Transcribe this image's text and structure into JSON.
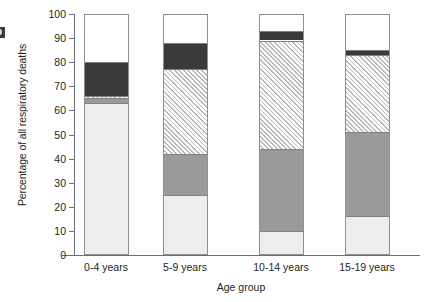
{
  "figure": {
    "edge_mark": "9"
  },
  "chart_data": {
    "type": "bar",
    "stacked": true,
    "title": "",
    "xlabel": "Age group",
    "ylabel": "Percentage of all respiratory deaths",
    "ylim": [
      0,
      100
    ],
    "grid": false,
    "legend_position": "none",
    "y_ticks": [
      0,
      10,
      20,
      30,
      40,
      50,
      60,
      70,
      80,
      90,
      100
    ],
    "y_tick_labels": [
      "0",
      "10",
      "20",
      "30",
      "40",
      "50",
      "60",
      "70",
      "80",
      "90",
      "100"
    ],
    "categories": [
      "0-4 years",
      "5-9 years",
      "10-14 years",
      "15-19 years"
    ],
    "series": [
      {
        "name": "light-grey-segment",
        "swatch": "#eeeeee",
        "values": [
          63,
          25,
          10,
          16
        ]
      },
      {
        "name": "grey-segment",
        "swatch": "#9a9a9c",
        "values": [
          2,
          17,
          34,
          35
        ]
      },
      {
        "name": "hatched-segment",
        "swatch": "hatch",
        "values": [
          1,
          35,
          45,
          32
        ]
      },
      {
        "name": "dark-segment",
        "swatch": "#3a3a3c",
        "values": [
          14,
          11,
          4,
          2
        ]
      },
      {
        "name": "white-segment",
        "swatch": "#ffffff",
        "values": [
          20,
          12,
          7,
          15
        ]
      }
    ],
    "stack_boundaries": {
      "0-4 years": [
        0,
        63,
        65,
        66,
        80,
        100
      ],
      "5-9 years": [
        0,
        25,
        42,
        77,
        88,
        100
      ],
      "10-14 years": [
        0,
        10,
        44,
        89,
        93,
        100
      ],
      "15-19 years": [
        0,
        16,
        51,
        83,
        85,
        100
      ]
    }
  }
}
